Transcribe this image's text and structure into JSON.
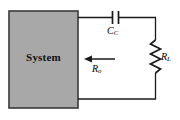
{
  "figure": {
    "type": "circuit-diagram",
    "title": "",
    "background_color": "#ffffff",
    "line_color": "#1a1a1a"
  },
  "system_block": {
    "label": "System",
    "fill_color": "#a8a8a8",
    "border_color": "#3a3a3a"
  },
  "components": {
    "capacitor": {
      "name": "coupling-capacitor",
      "symbol": "capacitor",
      "label_main": "C",
      "label_sub": "C",
      "label_full": "C_C"
    },
    "resistor": {
      "name": "load-resistor",
      "symbol": "resistor-zigzag",
      "label_main": "R",
      "label_sub": "L",
      "label_full": "R_L"
    },
    "output_resistance": {
      "name": "output-resistance-arrow",
      "symbol": "arrow-left",
      "label_main": "R",
      "label_sub": "o",
      "label_full": "R_o"
    }
  }
}
